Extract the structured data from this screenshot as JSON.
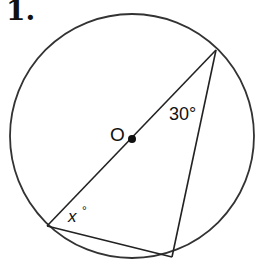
{
  "problem": {
    "number": "1."
  },
  "diagram": {
    "center_label": "O",
    "angle_top": "30°",
    "angle_left_var": "x",
    "angle_left_deg": "°",
    "colors": {
      "stroke": "#222222",
      "background": "#ffffff"
    }
  }
}
